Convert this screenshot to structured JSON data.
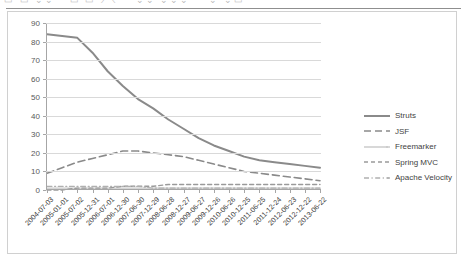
{
  "window": {
    "toolbar_fragment": "▭ ▭ ⌄⌄⌃ ▭ ▭ ⟋⟍ ⌃ ⌄⌄ ⌄⌄⌄ ⌃ ⌄ ⌄▭"
  },
  "chart_data": {
    "type": "line",
    "title": "",
    "subtitle": "",
    "xlabel": "",
    "ylabel": "",
    "ylim": [
      0,
      90
    ],
    "ytick_step": 10,
    "yticks": [
      0,
      10,
      20,
      30,
      40,
      50,
      60,
      70,
      80,
      90
    ],
    "grid": true,
    "legend_position": "right",
    "categories": [
      "2004-07-03",
      "2005-01-01",
      "2005-07-02",
      "2005-12-31",
      "2006-07-01",
      "2006-12-30",
      "2007-06-30",
      "2007-12-29",
      "2008-06-28",
      "2008-12-27",
      "2009-06-27",
      "2009-12-26",
      "2010-06-26",
      "2010-12-25",
      "2011-06-25",
      "2011-12-24",
      "2012-06-23",
      "2012-12-22",
      "2013-06-22"
    ],
    "series": [
      {
        "name": "Struts",
        "color": "#8a8a8a",
        "style": "solid",
        "width": 2.0,
        "values": [
          84,
          83,
          82,
          74,
          64,
          56,
          49,
          44,
          38,
          33,
          28,
          24,
          21,
          18,
          16,
          15,
          14,
          13,
          12
        ]
      },
      {
        "name": "JSF",
        "color": "#8a8a8a",
        "style": "dashed-long",
        "width": 1.6,
        "values": [
          9,
          12,
          15,
          17,
          19,
          21,
          21,
          20,
          19,
          18,
          16,
          14,
          12,
          10,
          9,
          8,
          7,
          6,
          5
        ]
      },
      {
        "name": "Freemarker",
        "color": "#c8c8c8",
        "style": "solid-dot",
        "width": 1.2,
        "values": [
          1,
          1,
          1,
          1,
          1,
          1,
          1,
          1,
          1,
          1,
          1,
          1,
          1,
          1,
          1,
          1,
          1,
          1,
          1
        ]
      },
      {
        "name": "Spring MVC",
        "color": "#9a9a9a",
        "style": "dashed",
        "width": 1.4,
        "values": [
          0,
          0,
          1,
          1,
          1,
          2,
          2,
          2,
          3,
          3,
          3,
          3,
          3,
          3,
          3,
          3,
          3,
          3,
          3
        ]
      },
      {
        "name": "Apache Velocity",
        "color": "#b0b0b0",
        "style": "dash-dot",
        "width": 1.2,
        "values": [
          2,
          2,
          2,
          2,
          2,
          2,
          2,
          1,
          1,
          1,
          1,
          1,
          1,
          1,
          1,
          1,
          1,
          1,
          1
        ]
      }
    ]
  }
}
